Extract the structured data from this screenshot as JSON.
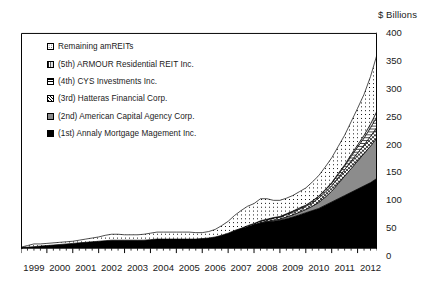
{
  "chart_data": {
    "type": "area",
    "title": "",
    "ylabel": "$ Billions",
    "xlabel": "",
    "ylim": [
      0,
      400
    ],
    "ytick_step": 50,
    "yticks": [
      0,
      50,
      100,
      150,
      200,
      250,
      300,
      350,
      400
    ],
    "xlim": [
      1999,
      2012.75
    ],
    "xticks": [
      "1999",
      "2000",
      "2001",
      "2002",
      "2003",
      "2004",
      "2005",
      "2006",
      "2007",
      "2008",
      "2009",
      "2010",
      "2011",
      "2012"
    ],
    "grid": false,
    "stacked": true,
    "legend_position": "inside-top-left",
    "x": [
      1999.0,
      1999.25,
      1999.5,
      1999.75,
      2000.0,
      2000.25,
      2000.5,
      2000.75,
      2001.0,
      2001.25,
      2001.5,
      2001.75,
      2002.0,
      2002.25,
      2002.5,
      2002.75,
      2003.0,
      2003.25,
      2003.5,
      2003.75,
      2004.0,
      2004.25,
      2004.5,
      2004.75,
      2005.0,
      2005.25,
      2005.5,
      2005.75,
      2006.0,
      2006.25,
      2006.5,
      2006.75,
      2007.0,
      2007.25,
      2007.5,
      2007.75,
      2008.0,
      2008.25,
      2008.5,
      2008.75,
      2009.0,
      2009.25,
      2009.5,
      2009.75,
      2010.0,
      2010.25,
      2010.5,
      2010.75,
      2011.0,
      2011.25,
      2011.5,
      2011.75,
      2012.0,
      2012.25,
      2012.5,
      2012.75
    ],
    "series": [
      {
        "name": "(1st) Annaly Mortgage Magement Inc.",
        "order": 1,
        "pattern": "solid-black",
        "color": "#000000",
        "values": [
          1,
          2,
          3,
          4,
          5,
          6,
          7,
          8,
          9,
          10,
          11,
          12,
          13,
          14,
          15,
          15,
          15,
          15,
          15,
          15,
          16,
          17,
          17,
          17,
          17,
          17,
          17,
          17,
          18,
          19,
          21,
          24,
          28,
          32,
          36,
          40,
          44,
          47,
          49,
          50,
          52,
          55,
          58,
          62,
          66,
          70,
          74,
          80,
          86,
          92,
          98,
          104,
          110,
          116,
          122,
          130
        ]
      },
      {
        "name": "(2nd) American Capital Agency Corp.",
        "order": 2,
        "pattern": "solid-gray",
        "color": "#8c8c8c",
        "values": [
          0,
          0,
          0,
          0,
          0,
          0,
          0,
          0,
          0,
          0,
          0,
          0,
          0,
          0,
          0,
          0,
          0,
          0,
          0,
          0,
          0,
          0,
          0,
          0,
          0,
          0,
          0,
          0,
          0,
          0,
          0,
          0,
          0,
          0,
          0,
          0,
          0,
          1,
          1,
          2,
          2,
          3,
          4,
          5,
          6,
          8,
          11,
          15,
          20,
          28,
          36,
          44,
          52,
          60,
          68,
          75
        ]
      },
      {
        "name": "(3rd) Hatteras Financial Corp.",
        "order": 3,
        "pattern": "checker",
        "color": "#ffffff",
        "values": [
          0,
          0,
          0,
          0,
          0,
          0,
          0,
          0,
          0,
          0,
          0,
          0,
          0,
          0,
          0,
          0,
          0,
          0,
          0,
          0,
          0,
          0,
          0,
          0,
          0,
          0,
          0,
          0,
          0,
          0,
          0,
          0,
          0,
          1,
          1,
          2,
          2,
          3,
          3,
          4,
          4,
          5,
          5,
          6,
          6,
          7,
          8,
          9,
          10,
          11,
          12,
          14,
          15,
          16,
          18,
          20
        ]
      },
      {
        "name": "(4th) CYS Investments Inc.",
        "order": 4,
        "pattern": "hlines",
        "color": "#ffffff",
        "values": [
          0,
          0,
          0,
          0,
          0,
          0,
          0,
          0,
          0,
          0,
          0,
          0,
          0,
          0,
          0,
          0,
          0,
          0,
          0,
          0,
          0,
          0,
          0,
          0,
          0,
          0,
          0,
          0,
          0,
          0,
          0,
          0,
          0,
          0,
          0,
          0,
          0,
          0,
          1,
          1,
          1,
          1,
          2,
          2,
          2,
          3,
          3,
          4,
          5,
          6,
          7,
          9,
          11,
          13,
          16,
          20
        ]
      },
      {
        "name": "(5th) ARMOUR Residential REIT Inc.",
        "order": 5,
        "pattern": "grid",
        "color": "#ffffff",
        "values": [
          0,
          0,
          0,
          0,
          0,
          0,
          0,
          0,
          0,
          0,
          0,
          0,
          0,
          0,
          0,
          0,
          0,
          0,
          0,
          0,
          0,
          0,
          0,
          0,
          0,
          0,
          0,
          0,
          0,
          0,
          0,
          0,
          0,
          0,
          0,
          0,
          0,
          0,
          0,
          0,
          0,
          0,
          0,
          0,
          0,
          0,
          1,
          1,
          1,
          2,
          2,
          3,
          4,
          5,
          7,
          10
        ]
      },
      {
        "name": "Remaining amREITs",
        "order": 6,
        "pattern": "dots",
        "color": "#ffffff",
        "values": [
          1,
          3,
          5,
          4,
          4,
          4,
          4,
          4,
          4,
          5,
          6,
          7,
          8,
          10,
          11,
          11,
          10,
          10,
          10,
          11,
          12,
          13,
          13,
          13,
          13,
          13,
          13,
          12,
          11,
          12,
          14,
          18,
          22,
          28,
          33,
          36,
          37,
          41,
          38,
          32,
          30,
          29,
          29,
          30,
          32,
          35,
          38,
          42,
          46,
          50,
          55,
          61,
          68,
          76,
          88,
          105
        ]
      }
    ],
    "totals_endpoint": 360
  },
  "legend": {
    "items": [
      {
        "label": "Remaining amREITs",
        "swatch": "dots"
      },
      {
        "label": "(5th) ARMOUR Residential REIT Inc.",
        "swatch": "grid"
      },
      {
        "label": "(4th) CYS Investments Inc.",
        "swatch": "hlines"
      },
      {
        "label": "(3rd) Hatteras Financial Corp.",
        "swatch": "checker"
      },
      {
        "label": "(2nd) American Capital Agency Corp.",
        "swatch": "solid-gray"
      },
      {
        "label": "(1st) Annaly Mortgage Magement Inc.",
        "swatch": "solid-black"
      }
    ]
  },
  "colors": {
    "axis": "#000000",
    "black_series": "#000000",
    "gray_series": "#8c8c8c",
    "background": "#ffffff"
  }
}
